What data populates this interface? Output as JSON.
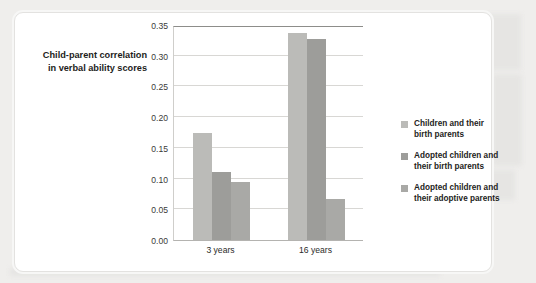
{
  "axis_title": {
    "line1": "Child-parent correlation",
    "line2": "in verbal ability scores"
  },
  "colors": {
    "series1": "#bbbbb8",
    "series2": "#9d9d9a",
    "series3": "#a9a9a6",
    "gridline": "#d8d7d4",
    "axis": "#8d8d8a",
    "text": "#1d1d1b",
    "card_background": "#ffffff",
    "page_background": "#efeeec"
  },
  "chart_data": {
    "type": "bar",
    "title": "",
    "xlabel": "",
    "ylabel": "Child-parent correlation in verbal ability scores",
    "categories": [
      "3 years",
      "16 years"
    ],
    "ylim": [
      0.0,
      0.35
    ],
    "yticks": [
      "0.00",
      "0.05",
      "0.10",
      "0.15",
      "0.20",
      "0.25",
      "0.30",
      "0.35"
    ],
    "ytick_values": [
      0.0,
      0.05,
      0.1,
      0.15,
      0.2,
      0.25,
      0.3,
      0.35
    ],
    "grid": true,
    "legend_position": "right",
    "series": [
      {
        "name": "Children and their birth parents",
        "name_line1": "Children and their",
        "name_line2": "birth parents",
        "color": "#bbbbb8",
        "values": [
          0.175,
          0.337
        ]
      },
      {
        "name": "Adopted children and their birth parents",
        "name_line1": "Adopted children and",
        "name_line2": "their birth parents",
        "color": "#9d9d9a",
        "values": [
          0.11,
          0.327
        ]
      },
      {
        "name": "Adopted children and their adoptive parents",
        "name_line1": "Adopted children and",
        "name_line2": "their adoptive parents",
        "color": "#a9a9a6",
        "values": [
          0.095,
          0.067
        ]
      }
    ]
  }
}
